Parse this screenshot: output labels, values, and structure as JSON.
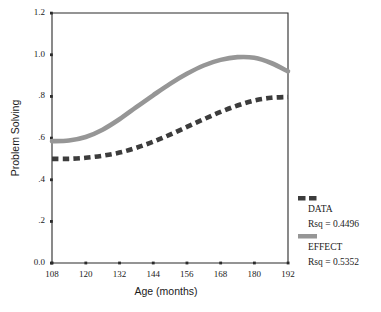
{
  "chart_data": {
    "type": "line",
    "title": "",
    "xlabel": "Age (months)",
    "ylabel": "Problem Solving",
    "xlim": [
      108,
      192
    ],
    "ylim": [
      0.0,
      1.2
    ],
    "xticks": [
      108,
      120,
      132,
      144,
      156,
      168,
      180,
      192
    ],
    "xtick_labels": [
      "108",
      "120",
      "132",
      "144",
      "156",
      "168",
      "180",
      "192"
    ],
    "yticks": [
      0.0,
      0.2,
      0.4,
      0.6,
      0.8,
      1.0,
      1.2
    ],
    "ytick_labels": [
      "0.0",
      ".2",
      ".4",
      ".6",
      ".8",
      "1.0",
      "1.2"
    ],
    "grid": false,
    "legend_position": "right-outside",
    "series": [
      {
        "name": "DATA",
        "style": "dashed",
        "color": "#3c3c3c",
        "rsq_label": "Rsq = 0.4496",
        "rsq": 0.4496,
        "x": [
          108,
          114,
          120,
          126,
          132,
          138,
          144,
          150,
          156,
          162,
          168,
          174,
          180,
          186,
          192
        ],
        "values": [
          0.5,
          0.5,
          0.505,
          0.515,
          0.53,
          0.553,
          0.582,
          0.616,
          0.653,
          0.69,
          0.725,
          0.756,
          0.78,
          0.793,
          0.797
        ]
      },
      {
        "name": "EFFECT",
        "style": "solid",
        "color": "#969696",
        "rsq_label": "Rsq = 0.5352",
        "rsq": 0.5352,
        "x": [
          108,
          114,
          120,
          126,
          132,
          138,
          144,
          150,
          156,
          162,
          168,
          174,
          180,
          186,
          192
        ],
        "values": [
          0.585,
          0.588,
          0.605,
          0.64,
          0.69,
          0.748,
          0.805,
          0.86,
          0.908,
          0.948,
          0.975,
          0.988,
          0.985,
          0.96,
          0.92
        ]
      }
    ]
  },
  "legend": {
    "entries": [
      {
        "label": "DATA",
        "rsq_label": "Rsq = 0.4496",
        "swatch": "dashed-swatch",
        "color": "#3c3c3c"
      },
      {
        "label": "EFFECT",
        "rsq_label": "Rsq = 0.5352",
        "swatch": "solid-swatch",
        "color": "#969696"
      }
    ]
  },
  "colors": {
    "data_series": "#3c3c3c",
    "effect_series": "#969696",
    "axis": "#2b2b2b",
    "background": "#ffffff"
  }
}
